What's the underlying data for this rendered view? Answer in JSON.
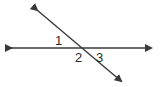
{
  "diagram": {
    "type": "intersecting-lines",
    "line_color": "#3a3a3a",
    "lines": [
      {
        "name": "horizontal-line",
        "x1": 11,
        "y1": 48,
        "x2": 151,
        "y2": 48
      },
      {
        "name": "transversal-line",
        "x1": 37,
        "y1": 10,
        "x2": 121,
        "y2": 81
      }
    ],
    "angle_labels": [
      {
        "text": "1",
        "x": 55,
        "y": 45
      },
      {
        "text": "2",
        "x": 75,
        "y": 62
      },
      {
        "text": "3",
        "x": 96,
        "y": 62
      }
    ]
  }
}
